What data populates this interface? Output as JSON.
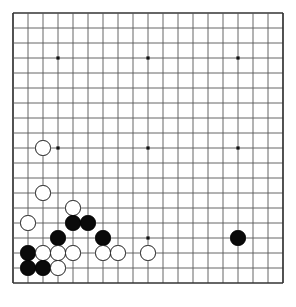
{
  "board": {
    "game": "Go",
    "size": 19,
    "label": "go-board",
    "grid": {
      "origin_x": 13,
      "origin_y": 13,
      "spacing": 15.0,
      "line_color": "#555555",
      "border_color": "#333333",
      "background_color": "#ffffff"
    },
    "star_points": [
      {
        "col": 3,
        "row": 3
      },
      {
        "col": 9,
        "row": 3
      },
      {
        "col": 15,
        "row": 3
      },
      {
        "col": 3,
        "row": 9
      },
      {
        "col": 9,
        "row": 9
      },
      {
        "col": 15,
        "row": 9
      },
      {
        "col": 3,
        "row": 15
      },
      {
        "col": 9,
        "row": 15
      },
      {
        "col": 15,
        "row": 15
      }
    ],
    "stone_colors": {
      "black": "#0a0a0a",
      "white": "#ffffff",
      "white_outline": "#1a1a1a"
    },
    "stone_radius": 7.6,
    "counts": {
      "black": 8,
      "white": 12,
      "total": 20
    },
    "stones": [
      {
        "color": "white",
        "col": 2,
        "row": 9
      },
      {
        "color": "white",
        "col": 2,
        "row": 12
      },
      {
        "color": "white",
        "col": 4,
        "row": 13
      },
      {
        "color": "white",
        "col": 1,
        "row": 14
      },
      {
        "color": "black",
        "col": 4,
        "row": 14
      },
      {
        "color": "black",
        "col": 5,
        "row": 14
      },
      {
        "color": "black",
        "col": 3,
        "row": 15
      },
      {
        "color": "black",
        "col": 6,
        "row": 15
      },
      {
        "color": "black",
        "col": 15,
        "row": 15
      },
      {
        "color": "black",
        "col": 1,
        "row": 16
      },
      {
        "color": "white",
        "col": 2,
        "row": 16
      },
      {
        "color": "white",
        "col": 3,
        "row": 16
      },
      {
        "color": "white",
        "col": 4,
        "row": 16
      },
      {
        "color": "white",
        "col": 6,
        "row": 16
      },
      {
        "color": "white",
        "col": 7,
        "row": 16
      },
      {
        "color": "white",
        "col": 9,
        "row": 16
      },
      {
        "color": "black",
        "col": 1,
        "row": 17
      },
      {
        "color": "black",
        "col": 2,
        "row": 17
      },
      {
        "color": "white",
        "col": 3,
        "row": 17
      }
    ]
  }
}
